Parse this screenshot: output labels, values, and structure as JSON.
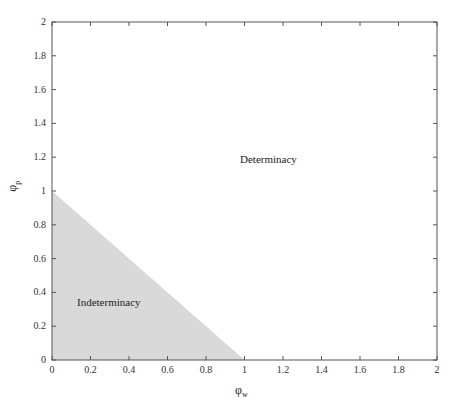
{
  "chart_data": {
    "type": "area",
    "title": "",
    "xlabel": "φ_w",
    "ylabel": "φ_p",
    "xlim": [
      0,
      2
    ],
    "ylim": [
      0,
      2
    ],
    "x_ticks": [
      "0",
      "0.2",
      "0.4",
      "0.6",
      "0.8",
      "1",
      "1.2",
      "1.4",
      "1.6",
      "1.8",
      "2"
    ],
    "y_ticks": [
      "0",
      "0.2",
      "0.4",
      "0.6",
      "0.8",
      "1",
      "1.2",
      "1.4",
      "1.6",
      "1.8",
      "2"
    ],
    "grid": false,
    "regions": [
      {
        "name": "Indeterminacy",
        "polygon": [
          [
            0,
            0
          ],
          [
            1,
            0
          ],
          [
            0,
            1
          ]
        ],
        "fill": "#d9d9d9"
      },
      {
        "name": "Determinacy",
        "description": "remaining area where φ_w + φ_p > 1",
        "fill": "#ffffff"
      }
    ],
    "annotations": [
      {
        "text": "Determinacy",
        "x": 1.1,
        "y": 1.17
      },
      {
        "text": "Indeterminacy",
        "x": 0.28,
        "y": 0.35
      }
    ]
  },
  "labels": {
    "xlabel_main": "φ",
    "xlabel_sub": "w",
    "ylabel_main": "φ",
    "ylabel_sub": "p",
    "determinacy": "Determinacy",
    "indeterminacy": "Indeterminacy"
  }
}
